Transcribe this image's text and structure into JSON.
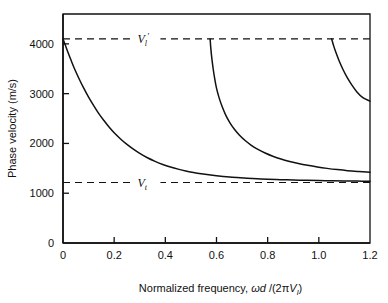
{
  "chart_data": {
    "type": "line",
    "title": "",
    "xlabel": "Normalized frequency, ωd /(2πVₗ)",
    "ylabel": "Phase velocity (m/s)",
    "xlim": [
      0,
      1.2
    ],
    "ylim": [
      0,
      4600
    ],
    "grid": false,
    "legend_position": "none",
    "xticks": [
      0,
      0.2,
      0.4,
      0.6,
      0.8,
      1.0,
      1.2
    ],
    "xtick_labels": [
      "0",
      "0.2",
      "0.4",
      "0.6",
      "0.8",
      "1.0",
      "1.2"
    ],
    "yticks": [
      0,
      1000,
      2000,
      3000,
      4000
    ],
    "ytick_labels": [
      "0",
      "1000",
      "2000",
      "3000",
      "4000"
    ],
    "annotations": [
      {
        "name": "upper-asymptote-label",
        "base": "V",
        "subscript": "l",
        "prime": "′",
        "value": 4100,
        "x": 0.33
      },
      {
        "name": "lower-asymptote-label",
        "base": "V",
        "subscript": "t",
        "prime": "",
        "value": 1215,
        "x": 0.33
      }
    ],
    "asymptotes": [
      {
        "name": "longitudinal-plate-velocity",
        "label": "V_l'",
        "y": 4100,
        "style": "dashed"
      },
      {
        "name": "shear-velocity",
        "label": "V_t",
        "y": 1215,
        "style": "dashed"
      }
    ],
    "series": [
      {
        "name": "mode-0",
        "label": "Mode 0",
        "color": "#111111",
        "points": [
          [
            0.0,
            4100
          ],
          [
            0.01,
            3960
          ],
          [
            0.02,
            3820
          ],
          [
            0.03,
            3690
          ],
          [
            0.045,
            3500
          ],
          [
            0.06,
            3330
          ],
          [
            0.08,
            3120
          ],
          [
            0.1,
            2930
          ],
          [
            0.12,
            2760
          ],
          [
            0.14,
            2600
          ],
          [
            0.16,
            2460
          ],
          [
            0.18,
            2330
          ],
          [
            0.2,
            2215
          ],
          [
            0.225,
            2090
          ],
          [
            0.25,
            1980
          ],
          [
            0.275,
            1885
          ],
          [
            0.3,
            1800
          ],
          [
            0.33,
            1712
          ],
          [
            0.36,
            1640
          ],
          [
            0.39,
            1578
          ],
          [
            0.42,
            1527
          ],
          [
            0.45,
            1484
          ],
          [
            0.48,
            1447
          ],
          [
            0.51,
            1417
          ],
          [
            0.54,
            1391
          ],
          [
            0.57,
            1369
          ],
          [
            0.6,
            1351
          ],
          [
            0.64,
            1331
          ],
          [
            0.68,
            1314
          ],
          [
            0.72,
            1301
          ],
          [
            0.76,
            1290
          ],
          [
            0.8,
            1281
          ],
          [
            0.85,
            1272
          ],
          [
            0.9,
            1265
          ],
          [
            0.95,
            1259
          ],
          [
            1.0,
            1254
          ],
          [
            1.05,
            1250
          ],
          [
            1.1,
            1246
          ],
          [
            1.15,
            1243
          ],
          [
            1.2,
            1240
          ]
        ]
      },
      {
        "name": "mode-1",
        "label": "Mode 1",
        "color": "#111111",
        "points": [
          [
            0.575,
            4100
          ],
          [
            0.578,
            3900
          ],
          [
            0.582,
            3700
          ],
          [
            0.587,
            3500
          ],
          [
            0.593,
            3300
          ],
          [
            0.6,
            3110
          ],
          [
            0.61,
            2920
          ],
          [
            0.622,
            2740
          ],
          [
            0.636,
            2570
          ],
          [
            0.652,
            2420
          ],
          [
            0.67,
            2285
          ],
          [
            0.69,
            2165
          ],
          [
            0.712,
            2058
          ],
          [
            0.736,
            1963
          ],
          [
            0.762,
            1880
          ],
          [
            0.79,
            1808
          ],
          [
            0.82,
            1744
          ],
          [
            0.852,
            1688
          ],
          [
            0.886,
            1639
          ],
          [
            0.92,
            1597
          ],
          [
            0.956,
            1560
          ],
          [
            0.994,
            1527
          ],
          [
            1.032,
            1499
          ],
          [
            1.072,
            1474
          ],
          [
            1.112,
            1453
          ],
          [
            1.155,
            1436
          ],
          [
            1.2,
            1420
          ]
        ]
      },
      {
        "name": "mode-2",
        "label": "Mode 2",
        "color": "#111111",
        "points": [
          [
            1.05,
            4100
          ],
          [
            1.058,
            3960
          ],
          [
            1.068,
            3810
          ],
          [
            1.08,
            3650
          ],
          [
            1.094,
            3490
          ],
          [
            1.11,
            3330
          ],
          [
            1.128,
            3180
          ],
          [
            1.148,
            3040
          ],
          [
            1.172,
            2920
          ],
          [
            1.2,
            2850
          ]
        ]
      }
    ]
  }
}
